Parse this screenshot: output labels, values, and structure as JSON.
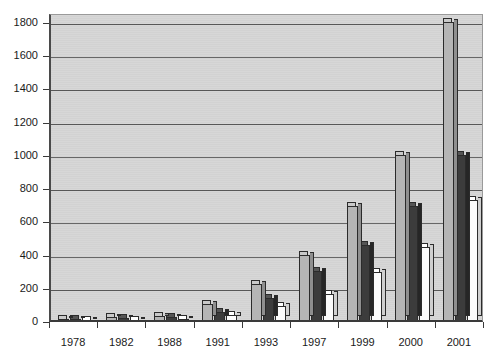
{
  "chart_data": {
    "type": "bar",
    "title": "",
    "subtitle": "",
    "xlabel": "",
    "ylabel": "",
    "categories": [
      "1978",
      "1982",
      "1988",
      "1991",
      "1993",
      "1997",
      "1999",
      "2000",
      "2001"
    ],
    "series": [
      {
        "name": "Series 1",
        "color": "#b5b5b5",
        "values": [
          15,
          22,
          30,
          105,
          225,
          400,
          690,
          1000,
          1800
        ]
      },
      {
        "name": "Series 2",
        "color": "#3c3c3c",
        "values": [
          10,
          18,
          25,
          55,
          140,
          300,
          455,
          690,
          1000
        ]
      },
      {
        "name": "Series 3",
        "color": "#fbfbfb",
        "values": [
          6,
          8,
          14,
          35,
          90,
          162,
          295,
          445,
          730
        ]
      }
    ],
    "ylim": [
      0,
      1800
    ],
    "yticks": [
      0,
      200,
      400,
      600,
      800,
      1000,
      1200,
      1400,
      1600,
      1800
    ],
    "ytick_labels": [
      "0",
      "200",
      "400",
      "600",
      "800",
      "1000",
      "1200",
      "1400",
      "1600",
      "1800"
    ],
    "grid": true,
    "grid_axis": "y",
    "legend": false,
    "legend_position": "none",
    "plot_background": "#d3d3d3",
    "figure_background": "#ffffff",
    "bar_style": "3d-grouped"
  },
  "axes": {
    "y_axis_name": "y-axis",
    "x_axis_name": "x-axis"
  }
}
